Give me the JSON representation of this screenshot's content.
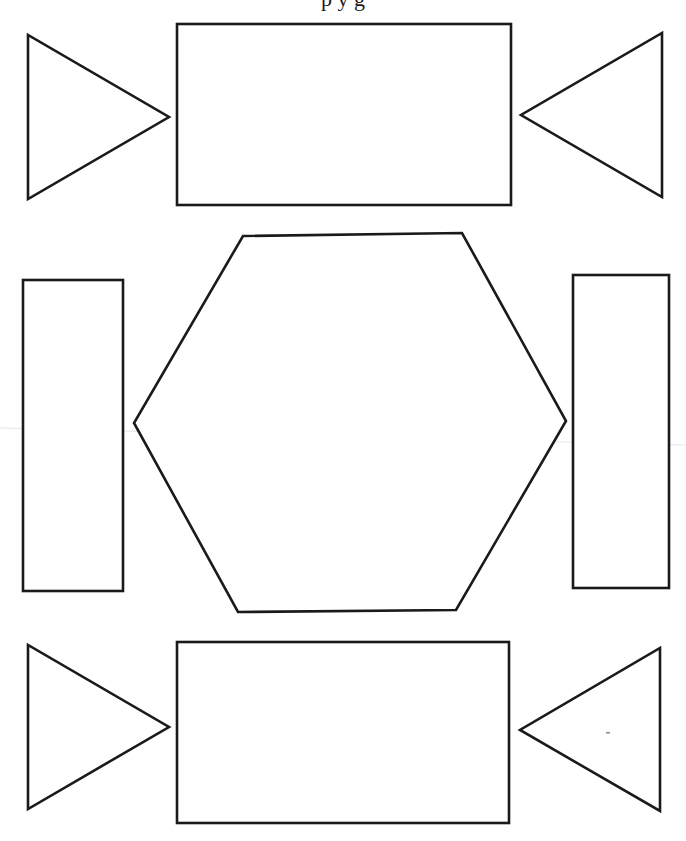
{
  "page": {
    "title_visible_fragment": "p y g"
  },
  "colors": {
    "background": "#ffffff",
    "stroke": "#1a1a1a"
  },
  "shapes": {
    "top_left_triangle": {
      "points": "28,35 28,199 169,117"
    },
    "top_rectangle": {
      "x": 177,
      "y": 24,
      "width": 334,
      "height": 181
    },
    "top_right_triangle": {
      "points": "662,33 662,197 521,115"
    },
    "left_rectangle": {
      "x": 23,
      "y": 280,
      "width": 100,
      "height": 311
    },
    "hexagon": {
      "points": "243,236 462,233 566,421 456,610 238,612 134,423"
    },
    "right_rectangle": {
      "x": 573,
      "y": 275,
      "width": 96,
      "height": 313
    },
    "bottom_left_triangle": {
      "points": "28,645 28,809 169,727"
    },
    "bottom_rectangle": {
      "x": 177,
      "y": 642,
      "width": 332,
      "height": 181
    },
    "bottom_right_triangle": {
      "points": "660,648 660,811 520,730"
    }
  }
}
